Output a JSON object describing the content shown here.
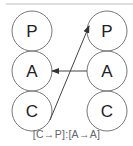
{
  "diagram": {
    "left_column": [
      "P",
      "A",
      "C"
    ],
    "right_column": [
      "P",
      "A",
      "C"
    ],
    "arrows": [
      {
        "from": {
          "column": "left",
          "label": "C"
        },
        "to": {
          "column": "right",
          "label": "P"
        }
      },
      {
        "from": {
          "column": "right",
          "label": "A"
        },
        "to": {
          "column": "left",
          "label": "A"
        }
      }
    ],
    "caption": "[C→P]:[A→A]",
    "colors": {
      "stroke": "#777777",
      "text": "#222222",
      "arrow": "#444444",
      "top_rule": "#bbbbbb"
    }
  }
}
